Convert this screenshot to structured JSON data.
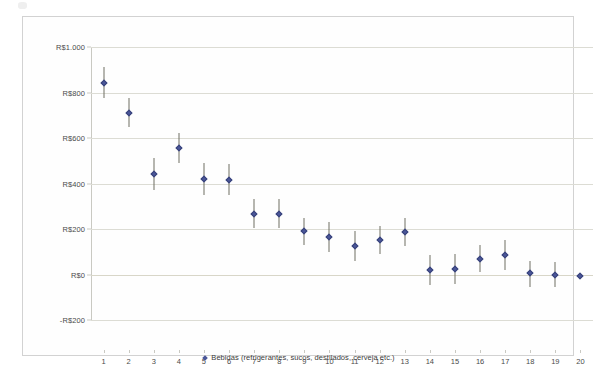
{
  "chart_data": {
    "type": "scatter",
    "title": "",
    "subtitle": "",
    "xlabel": "",
    "ylabel": "",
    "grid": true,
    "legend_position": "bottom",
    "x": [
      1,
      2,
      3,
      4,
      5,
      6,
      7,
      8,
      9,
      10,
      11,
      12,
      13,
      14,
      15,
      16,
      17,
      18,
      19,
      20
    ],
    "xtick_labels": [
      "1",
      "2",
      "3",
      "4",
      "5",
      "6",
      "7",
      "8",
      "9",
      "10",
      "11",
      "12",
      "13",
      "14",
      "15",
      "16",
      "17",
      "18",
      "19",
      "20"
    ],
    "xlim": [
      0.5,
      20.5
    ],
    "ylim": [
      -200,
      1000
    ],
    "ytick_labels": [
      "R$1.000",
      "R$800",
      "R$600",
      "R$400",
      "R$200",
      "R$0",
      "-R$200"
    ],
    "ytick_values": [
      1000,
      800,
      600,
      400,
      200,
      0,
      -200
    ],
    "currency_prefix": "R$",
    "series": [
      {
        "name": "Bebidas (refrigerantes, sucos, destilados, cerveja etc.)",
        "color": "#4a5699",
        "marker": "diamond",
        "errorbar_color": "#6f6f63",
        "values": [
          840,
          710,
          440,
          555,
          420,
          415,
          265,
          265,
          190,
          165,
          125,
          150,
          185,
          20,
          25,
          70,
          85,
          5,
          0,
          -5
        ],
        "error_low": [
          775,
          650,
          370,
          490,
          350,
          350,
          205,
          205,
          130,
          100,
          60,
          90,
          125,
          -45,
          -40,
          10,
          20,
          -55,
          -55,
          -5
        ],
        "error_high": [
          910,
          775,
          510,
          620,
          490,
          485,
          330,
          330,
          250,
          230,
          190,
          215,
          250,
          85,
          90,
          130,
          150,
          60,
          55,
          -5
        ]
      }
    ]
  },
  "legend": {
    "entries": [
      {
        "label": "Bebidas (refrigerantes, sucos, destilados, cerveja etc.)",
        "color": "#4a5699"
      }
    ]
  },
  "colors": {
    "marker": "#4a5699",
    "errorbar": "#6f6f63",
    "gridline": "#dcdcd4",
    "frame": "#d2d2d2",
    "axis": "#c9c9c2",
    "text": "#4a4a4a",
    "background": "#ffffff"
  }
}
